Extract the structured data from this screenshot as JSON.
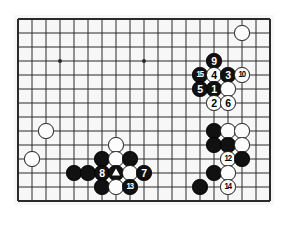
{
  "diagram": {
    "type": "go-board-problem",
    "board": {
      "columns": 19,
      "rows": 14,
      "origin_x": 18,
      "origin_y": 19,
      "spacing": 14,
      "line_color": "#2b2b2b",
      "background_color": "#f7f7f7",
      "border_color": "#222222"
    },
    "star_points": [
      {
        "col": 3,
        "row": 3
      },
      {
        "col": 9,
        "row": 3
      },
      {
        "col": 15,
        "row": 10
      }
    ],
    "stone_radius": 7.6,
    "colors": {
      "black_stone": "#111111",
      "white_stone": "#fdfdfd",
      "black_label": "#ffffff",
      "white_label": "#000000"
    },
    "stones": [
      {
        "col": 16,
        "row": 1,
        "color": "white",
        "label": ""
      },
      {
        "col": 14,
        "row": 3,
        "color": "black",
        "label": "9"
      },
      {
        "col": 13,
        "row": 4,
        "color": "black",
        "label": "15"
      },
      {
        "col": 14,
        "row": 4,
        "color": "white",
        "label": "4"
      },
      {
        "col": 15,
        "row": 4,
        "color": "black",
        "label": "3"
      },
      {
        "col": 16,
        "row": 4,
        "color": "white",
        "label": "10"
      },
      {
        "col": 13,
        "row": 5,
        "color": "black",
        "label": "5"
      },
      {
        "col": 14,
        "row": 5,
        "color": "black",
        "label": "1"
      },
      {
        "col": 15,
        "row": 5,
        "color": "white",
        "label": ""
      },
      {
        "col": 14,
        "row": 6,
        "color": "white",
        "label": "2"
      },
      {
        "col": 15,
        "row": 6,
        "color": "white",
        "label": "6"
      },
      {
        "col": 2,
        "row": 8,
        "color": "white",
        "label": ""
      },
      {
        "col": 14,
        "row": 8,
        "color": "black",
        "label": ""
      },
      {
        "col": 15,
        "row": 8,
        "color": "white",
        "label": ""
      },
      {
        "col": 16,
        "row": 8,
        "color": "white",
        "label": ""
      },
      {
        "col": 7,
        "row": 9,
        "color": "white",
        "label": ""
      },
      {
        "col": 14,
        "row": 9,
        "color": "black",
        "label": ""
      },
      {
        "col": 15,
        "row": 9,
        "color": "black",
        "label": ""
      },
      {
        "col": 16,
        "row": 9,
        "color": "white",
        "label": ""
      },
      {
        "col": 1,
        "row": 10,
        "color": "white",
        "label": ""
      },
      {
        "col": 6,
        "row": 10,
        "color": "black",
        "label": ""
      },
      {
        "col": 7,
        "row": 10,
        "color": "white",
        "label": ""
      },
      {
        "col": 8,
        "row": 10,
        "color": "black",
        "label": ""
      },
      {
        "col": 15,
        "row": 10,
        "color": "white",
        "label": "12"
      },
      {
        "col": 16,
        "row": 10,
        "color": "black",
        "label": ""
      },
      {
        "col": 4,
        "row": 11,
        "color": "black",
        "label": ""
      },
      {
        "col": 5,
        "row": 11,
        "color": "black",
        "label": ""
      },
      {
        "col": 6,
        "row": 11,
        "color": "black",
        "label": "8"
      },
      {
        "col": 7,
        "row": 11,
        "color": "black",
        "label": "",
        "mark": "triangle"
      },
      {
        "col": 8,
        "row": 11,
        "color": "white",
        "label": ""
      },
      {
        "col": 9,
        "row": 11,
        "color": "black",
        "label": "7"
      },
      {
        "col": 14,
        "row": 11,
        "color": "black",
        "label": ""
      },
      {
        "col": 15,
        "row": 11,
        "color": "white",
        "label": ""
      },
      {
        "col": 6,
        "row": 12,
        "color": "black",
        "label": ""
      },
      {
        "col": 7,
        "row": 12,
        "color": "white",
        "label": ""
      },
      {
        "col": 8,
        "row": 12,
        "color": "black",
        "label": "13"
      },
      {
        "col": 13,
        "row": 12,
        "color": "black",
        "label": ""
      },
      {
        "col": 15,
        "row": 12,
        "color": "white",
        "label": "14"
      }
    ]
  }
}
